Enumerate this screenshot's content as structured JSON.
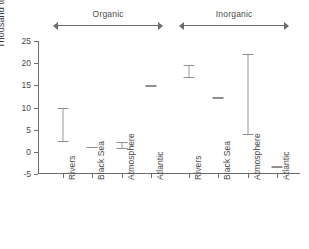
{
  "chart_data": {
    "type": "scatter",
    "title": "",
    "xlabel": "",
    "ylabel": "Thousand tonnes per year",
    "ylim": [
      -5,
      25
    ],
    "yticks": [
      25,
      20,
      15,
      10,
      5,
      0,
      -5
    ],
    "ytick_labels": [
      "25",
      "20",
      "15",
      "10",
      "5",
      "0",
      "-5"
    ],
    "grid": false,
    "legend": "none",
    "groups": [
      {
        "label": "Organic",
        "start_index": 0,
        "end_index": 3
      },
      {
        "label": "Inorganic",
        "start_index": 4,
        "end_index": 7
      }
    ],
    "categories": [
      "Rivers",
      "Black Sea",
      "Atmosphere",
      "Atlantic",
      "Rivers",
      "Black Sea",
      "Atmosphere",
      "Atlantic"
    ],
    "points": [
      {
        "group": "Organic",
        "category": "Rivers",
        "value": 6.3,
        "low": 2.5,
        "high": 10.0,
        "has_range": true
      },
      {
        "group": "Organic",
        "category": "Black Sea",
        "value": 1.2,
        "low": 1.2,
        "high": 1.2,
        "has_range": false
      },
      {
        "group": "Organic",
        "category": "Atmosphere",
        "value": 1.4,
        "low": 0.8,
        "high": 2.2,
        "has_range": true
      },
      {
        "group": "Organic",
        "category": "Atlantic",
        "value": 15.0,
        "low": 15.0,
        "high": 15.0,
        "has_range": false
      },
      {
        "group": "Inorganic",
        "category": "Rivers",
        "value": 18.2,
        "low": 16.8,
        "high": 19.5,
        "has_range": true
      },
      {
        "group": "Inorganic",
        "category": "Black Sea",
        "value": 12.3,
        "low": 12.3,
        "high": 12.3,
        "has_range": false
      },
      {
        "group": "Inorganic",
        "category": "Atmosphere",
        "value": 13.0,
        "low": 4.0,
        "high": 22.0,
        "has_range": true
      },
      {
        "group": "Inorganic",
        "category": "Atlantic",
        "value": -3.3,
        "low": -3.3,
        "high": -3.3,
        "has_range": false
      }
    ],
    "colors": {
      "axis": "#6b6b6b",
      "marker": "#8f8f8f",
      "text": "#3a3a3a",
      "background": "#ffffff"
    }
  }
}
